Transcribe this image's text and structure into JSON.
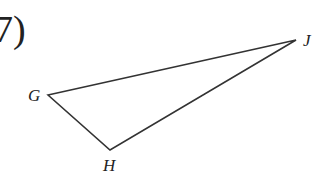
{
  "problem": {
    "number_label": "7)"
  },
  "figure": {
    "type": "triangle",
    "stroke_color": "#333333",
    "vertices": [
      {
        "name": "G",
        "label": "G",
        "x": 48,
        "y": 95
      },
      {
        "name": "J",
        "label": "J",
        "x": 296,
        "y": 40
      },
      {
        "name": "H",
        "label": "H",
        "x": 110,
        "y": 150
      }
    ]
  }
}
